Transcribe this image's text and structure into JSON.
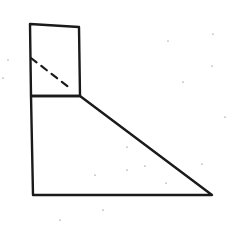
{
  "diagram": {
    "type": "geometric-figure",
    "colors": {
      "stroke": "#1a1a1a",
      "background": "#ffffff",
      "speck": "#555555"
    },
    "shapes": {
      "top_square": {
        "points": "30,24 79,27 80,96 31,96"
      },
      "bottom_trapezoid": {
        "points": "31,96 80,96 212,195 33,195"
      },
      "dashed_line": {
        "x1": 31,
        "y1": 58,
        "x2": 71,
        "y2": 89
      }
    },
    "specks": [
      [
        168,
        41
      ],
      [
        212,
        66
      ],
      [
        213,
        34
      ],
      [
        183,
        82
      ],
      [
        225,
        117
      ],
      [
        127,
        147
      ],
      [
        145,
        166
      ],
      [
        202,
        164
      ],
      [
        127,
        170
      ],
      [
        166,
        183
      ],
      [
        95,
        175
      ],
      [
        103,
        210
      ],
      [
        60,
        220
      ],
      [
        8,
        60
      ],
      [
        3,
        78
      ]
    ]
  }
}
